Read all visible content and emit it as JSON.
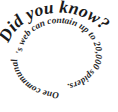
{
  "graphic": {
    "kind": "spiral-text-fact-badge",
    "background_color": "#ffffff",
    "text_color": "#1a1a1a",
    "outer_heading": "Did you know?",
    "inner_fact": "One communal spider's web can contain up to 20,000 spiders.",
    "inner_fact_segments": [
      "'s web can contain up to 20,000 spiders.",
      "One communal spider"
    ],
    "inner_fact_number": "20,000",
    "width": 118,
    "height": 112
  }
}
